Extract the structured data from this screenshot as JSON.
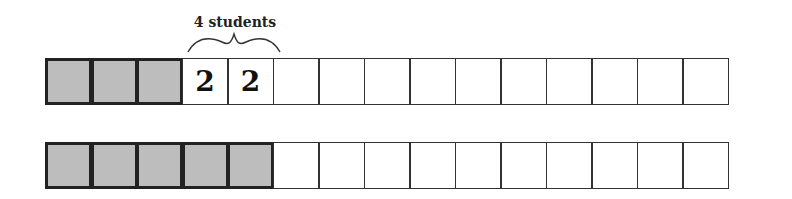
{
  "diagram": {
    "type": "tape-diagram",
    "label": {
      "text": "4 students",
      "spans_cells": [
        3,
        4
      ]
    },
    "rows": [
      {
        "name": "row-1",
        "total_cells": 15,
        "cells": [
          {
            "shaded": true,
            "value": ""
          },
          {
            "shaded": true,
            "value": ""
          },
          {
            "shaded": true,
            "value": ""
          },
          {
            "shaded": false,
            "value": "2"
          },
          {
            "shaded": false,
            "value": "2"
          },
          {
            "shaded": false,
            "value": ""
          },
          {
            "shaded": false,
            "value": ""
          },
          {
            "shaded": false,
            "value": ""
          },
          {
            "shaded": false,
            "value": ""
          },
          {
            "shaded": false,
            "value": ""
          },
          {
            "shaded": false,
            "value": ""
          },
          {
            "shaded": false,
            "value": ""
          },
          {
            "shaded": false,
            "value": ""
          },
          {
            "shaded": false,
            "value": ""
          },
          {
            "shaded": false,
            "value": ""
          }
        ]
      },
      {
        "name": "row-2",
        "total_cells": 15,
        "cells": [
          {
            "shaded": true,
            "value": ""
          },
          {
            "shaded": true,
            "value": ""
          },
          {
            "shaded": true,
            "value": ""
          },
          {
            "shaded": true,
            "value": ""
          },
          {
            "shaded": true,
            "value": ""
          },
          {
            "shaded": false,
            "value": ""
          },
          {
            "shaded": false,
            "value": ""
          },
          {
            "shaded": false,
            "value": ""
          },
          {
            "shaded": false,
            "value": ""
          },
          {
            "shaded": false,
            "value": ""
          },
          {
            "shaded": false,
            "value": ""
          },
          {
            "shaded": false,
            "value": ""
          },
          {
            "shaded": false,
            "value": ""
          },
          {
            "shaded": false,
            "value": ""
          },
          {
            "shaded": false,
            "value": ""
          }
        ]
      }
    ],
    "colors": {
      "shaded_fill": "#bdbdbd",
      "border": "#333333",
      "background": "#ffffff"
    }
  }
}
